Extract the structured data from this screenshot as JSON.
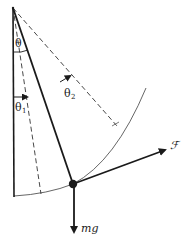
{
  "diagram": {
    "type": "pendulum-force-diagram",
    "colors": {
      "line": "#1a1a1a",
      "dashed": "#333333",
      "arc": "#555555",
      "background": "#ffffff"
    },
    "labels": {
      "theta": "θ",
      "theta1": "θ",
      "theta1_sub": "1",
      "theta2": "θ",
      "theta2_sub": "2",
      "force": "ℱ",
      "weight": "mg"
    },
    "elements": {
      "pivot": "pivot-point",
      "vertical_line": "vertical-reference-line",
      "string": "pendulum-string",
      "bob": "pendulum-bob",
      "arc": "swing-arc",
      "dashed_theta1": "dashed-line-theta1",
      "dashed_theta2": "dashed-line-theta2",
      "force_arrow": "applied-force-arrow",
      "weight_arrow": "weight-arrow"
    }
  }
}
